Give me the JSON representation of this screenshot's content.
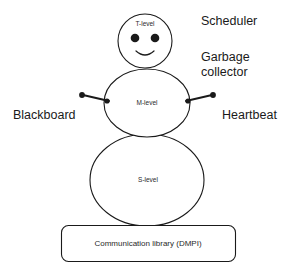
{
  "diagram": {
    "stroke_color": "#1a1a1a",
    "background_color": "#ffffff",
    "nodes": {
      "head": {
        "label": "T-level",
        "shape": "circle",
        "cx": 145,
        "cy": 41,
        "r": 27
      },
      "middle": {
        "label": "M-level",
        "shape": "circle",
        "cx": 147,
        "cy": 103,
        "r": 42
      },
      "body": {
        "label": "S-level",
        "shape": "circle",
        "cx": 147,
        "cy": 180,
        "r": 56
      },
      "base": {
        "label": "Communication library (DMPI)",
        "shape": "rounded-rect"
      }
    },
    "annotations": {
      "scheduler": "Scheduler",
      "garbage_collector_line1": "Garbage",
      "garbage_collector_line2": "collector",
      "blackboard": "Blackboard",
      "heartbeat": "Heartbeat"
    },
    "connectors": [
      {
        "name": "left-arm",
        "from": "M-level",
        "to": "Blackboard"
      },
      {
        "name": "right-arm",
        "from": "M-level",
        "to": "Heartbeat"
      }
    ]
  }
}
